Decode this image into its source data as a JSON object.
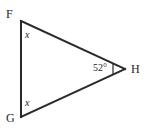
{
  "figure": {
    "type": "geometry-triangle-diagram",
    "canvas": {
      "width": 147,
      "height": 132,
      "background": "#ffffff"
    },
    "stroke_color": "#2a2a2a",
    "text_color": "#1e1e1e",
    "triangle": {
      "name": "FGH",
      "vertices": [
        {
          "id": "F",
          "label": "F",
          "x": 21,
          "y": 21
        },
        {
          "id": "G",
          "label": "G",
          "x": 21,
          "y": 117
        },
        {
          "id": "H",
          "label": "H",
          "x": 125,
          "y": 69
        }
      ],
      "sides": [
        {
          "from": "F",
          "to": "G"
        },
        {
          "from": "F",
          "to": "H"
        },
        {
          "from": "G",
          "to": "H"
        }
      ]
    },
    "angle_labels": [
      {
        "at_vertex": "F",
        "text": "x",
        "style": "italic"
      },
      {
        "at_vertex": "G",
        "text": "x",
        "style": "italic"
      },
      {
        "at_vertex": "H",
        "text": "52°",
        "style": "normal"
      }
    ],
    "angle_tick": {
      "at_vertex": "H",
      "description": "small-vertical-tick-mark"
    }
  }
}
